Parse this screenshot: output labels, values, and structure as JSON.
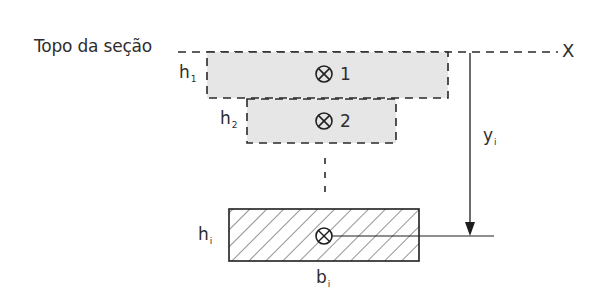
{
  "diagram": {
    "top_label": "Topo da seção",
    "axis_label": "X",
    "elements": [
      {
        "id": "1",
        "height_label": "h",
        "height_sub": "1",
        "fill": "#e6e6e6",
        "border": "dashed"
      },
      {
        "id": "2",
        "height_label": "h",
        "height_sub": "2",
        "fill": "#e6e6e6",
        "border": "dashed"
      },
      {
        "id": "i",
        "height_label": "h",
        "height_sub": "i",
        "width_label": "b",
        "width_sub": "i",
        "fill": "hatched",
        "border": "solid"
      }
    ],
    "distance_label": "y",
    "distance_sub": "i",
    "ellipsis": "⋮",
    "centroid_symbol": "circle-cross"
  },
  "colors": {
    "stroke": "#1e1e1e",
    "fill_gray": "#e6e6e6",
    "background": "#ffffff"
  }
}
